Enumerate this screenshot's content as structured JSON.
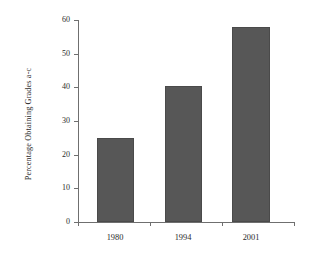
{
  "chart_data": {
    "type": "bar",
    "title": "",
    "xlabel": "",
    "ylabel": "Percentage Obtaining Grades a-c",
    "categories": [
      "1980",
      "1994",
      "2001"
    ],
    "values": [
      25,
      40.5,
      58
    ],
    "series": [
      {
        "name": "Percentage Obtaining Grades a-c",
        "values": [
          25,
          40.5,
          58
        ]
      }
    ],
    "ylim": [
      0,
      60
    ],
    "ytick_labels": [
      "60",
      "50",
      "40",
      "30",
      "20",
      "10",
      "0"
    ],
    "ytick_values": [
      60,
      50,
      40,
      30,
      20,
      10,
      0
    ],
    "grid": false,
    "legend": "none",
    "bar_color": "#575757",
    "axis_color": "#6f6f6f",
    "background_color": "#ffffff",
    "text_color": "#2b2b2b"
  },
  "axes": {
    "y_title": "Percentage Obtaining Grades a-c"
  }
}
